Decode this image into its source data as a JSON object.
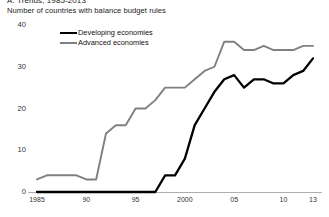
{
  "figure": {
    "title": "A. Trends, 1985-2013",
    "subtitle": "Number of countries with balance budget rules"
  },
  "legend": {
    "items": [
      {
        "label": "Developing economies",
        "color": "#000000"
      },
      {
        "label": "Advanced economies",
        "color": "#808080"
      }
    ]
  },
  "axes": {
    "y_ticks": [
      "0",
      "10",
      "20",
      "30",
      "40"
    ],
    "x_ticks": [
      "1985",
      "90",
      "95",
      "2000",
      "05",
      "10",
      "13"
    ]
  },
  "chart_data": {
    "type": "line",
    "title": "A. Trends, 1985-2013",
    "subtitle": "Number of countries with balance budget rules",
    "xlabel": "",
    "ylabel": "Number of countries with balance budget rules",
    "xlim": [
      1985,
      2013
    ],
    "ylim": [
      0,
      40
    ],
    "yticks": [
      0,
      10,
      20,
      30,
      40
    ],
    "xticks": [
      1985,
      1990,
      1995,
      2000,
      2005,
      2010,
      2013
    ],
    "xticklabels": [
      "1985",
      "90",
      "95",
      "2000",
      "05",
      "10",
      "13"
    ],
    "grid": false,
    "legend_position": "upper-left-inside",
    "x": [
      1985,
      1986,
      1987,
      1988,
      1989,
      1990,
      1991,
      1992,
      1993,
      1994,
      1995,
      1996,
      1997,
      1998,
      1999,
      2000,
      2001,
      2002,
      2003,
      2004,
      2005,
      2006,
      2007,
      2008,
      2009,
      2010,
      2011,
      2012,
      2013
    ],
    "series": [
      {
        "name": "Advanced economies",
        "color": "#808080",
        "values": [
          3,
          4,
          4,
          4,
          4,
          3,
          3,
          14,
          16,
          16,
          20,
          20,
          22,
          25,
          25,
          25,
          27,
          29,
          30,
          36,
          36,
          34,
          34,
          35,
          34,
          34,
          34,
          35,
          35
        ]
      },
      {
        "name": "Developing economies",
        "color": "#000000",
        "values": [
          0,
          0,
          0,
          0,
          0,
          0,
          0,
          0,
          0,
          0,
          0,
          0,
          0,
          4,
          4,
          8,
          16,
          20,
          24,
          27,
          28,
          25,
          27,
          27,
          26,
          26,
          28,
          29,
          32
        ]
      }
    ]
  }
}
